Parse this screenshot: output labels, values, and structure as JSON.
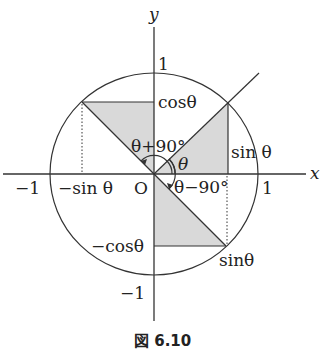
{
  "figure": {
    "caption": "図 6.10",
    "axes": {
      "x_label": "x",
      "y_label": "y",
      "origin_label": "O"
    },
    "ticks": {
      "x_pos": "1",
      "x_neg": "−1",
      "y_pos": "1",
      "y_neg": "−1"
    },
    "labels": {
      "cos_theta": "cosθ",
      "sin_theta_right": "sin θ",
      "neg_sin_theta": "−sin θ",
      "neg_cos_theta": "−cosθ",
      "sin_theta_bottom": "sinθ",
      "theta": "θ",
      "theta_plus_90": "θ+90°",
      "theta_minus_90": "θ−90°"
    },
    "colors": {
      "line": "#333333",
      "shade": "#d9d9d9",
      "background": "#ffffff"
    }
  },
  "diagram": {
    "type": "unit-circle",
    "origin_px": [
      154,
      174
    ],
    "radius_px": [
      104,
      101
    ],
    "points": {
      "P_theta": [
        228,
        103
      ],
      "P_theta_plus_90": [
        82,
        102
      ],
      "P_theta_minus_90": [
        226,
        246
      ]
    }
  }
}
